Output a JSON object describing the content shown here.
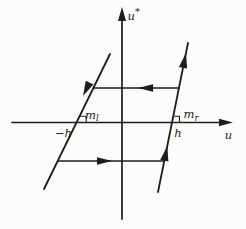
{
  "figure": {
    "background_color": "#fcfcfa",
    "line_color": "#1d1d1b"
  },
  "labels": {
    "y_axis": {
      "main": "u",
      "superscript": "*"
    },
    "x_axis": "u",
    "left_threshold": "−h",
    "right_threshold": "h",
    "left_slope": {
      "main": "m",
      "sub": "l"
    },
    "right_slope": {
      "main": "m",
      "sub": "r"
    }
  }
}
